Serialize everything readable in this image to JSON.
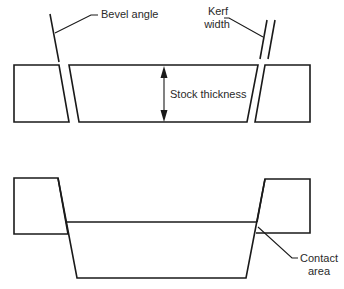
{
  "diagram": {
    "colors": {
      "line": "#1a1a1a",
      "text": "#2a2a2a",
      "background": "#ffffff"
    },
    "top_view": {
      "description": "Stock cut with beveled kerf, pieces separated",
      "labels": {
        "bevel_angle": "Bevel angle",
        "kerf_line1": "Kerf",
        "kerf_line2": "width",
        "stock_thickness": "Stock thickness"
      }
    },
    "bottom_view": {
      "description": "Beveled pieces shifted showing contact area",
      "labels": {
        "contact_line1": "Contact",
        "contact_line2": "area"
      }
    }
  }
}
